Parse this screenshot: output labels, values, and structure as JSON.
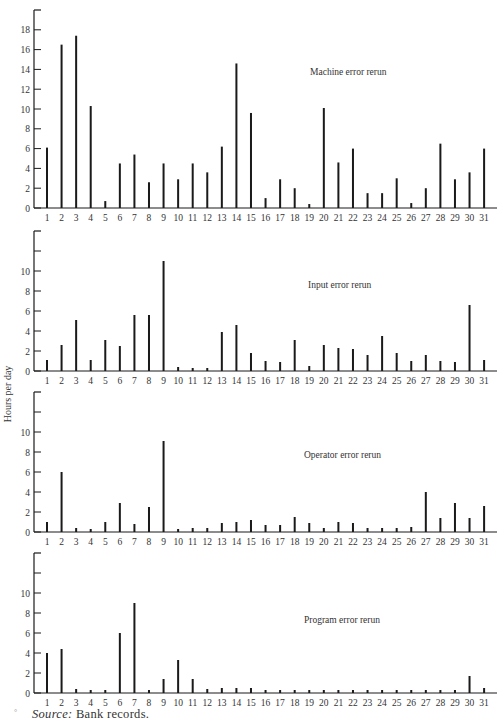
{
  "figure": {
    "y_axis_label": "Hours per day",
    "source_label": "Source:",
    "source_text": " Bank records.",
    "source_mark": "°"
  },
  "chart_data": [
    {
      "type": "bar",
      "title": "Machine error rerun",
      "xlabel": "",
      "ylabel": "Hours per day",
      "categories": [
        "1",
        "2",
        "3",
        "4",
        "5",
        "6",
        "7",
        "8",
        "9",
        "10",
        "11",
        "12",
        "13",
        "14",
        "15",
        "16",
        "17",
        "18",
        "19",
        "20",
        "21",
        "22",
        "23",
        "24",
        "25",
        "26",
        "27",
        "28",
        "29",
        "30",
        "31"
      ],
      "values": [
        6.1,
        16.5,
        17.4,
        10.3,
        0.7,
        4.5,
        5.4,
        2.6,
        4.5,
        2.9,
        4.5,
        3.6,
        6.2,
        14.6,
        9.6,
        1.0,
        2.9,
        2.0,
        0.4,
        10.1,
        4.6,
        6.0,
        1.5,
        1.5,
        3.0,
        0.5,
        2.0,
        6.5,
        2.9,
        3.6,
        6.0
      ],
      "ylim": [
        0,
        20
      ],
      "yticks": [
        0,
        2,
        4,
        6,
        8,
        10,
        12,
        14,
        16,
        18
      ],
      "grid": false,
      "legend": "none"
    },
    {
      "type": "bar",
      "title": "Input error rerun",
      "xlabel": "",
      "ylabel": "Hours per day",
      "categories": [
        "1",
        "2",
        "3",
        "4",
        "5",
        "6",
        "7",
        "8",
        "9",
        "10",
        "11",
        "12",
        "13",
        "14",
        "15",
        "16",
        "17",
        "18",
        "19",
        "20",
        "21",
        "22",
        "23",
        "24",
        "25",
        "26",
        "27",
        "28",
        "29",
        "30",
        "31"
      ],
      "values": [
        1.1,
        2.6,
        5.1,
        1.1,
        3.1,
        2.5,
        5.6,
        5.6,
        11.0,
        0.4,
        0.3,
        0.3,
        3.9,
        4.6,
        1.8,
        1.0,
        0.9,
        3.1,
        0.5,
        2.6,
        2.3,
        2.2,
        1.6,
        3.5,
        1.8,
        1.0,
        1.6,
        1.0,
        0.9,
        6.6,
        1.1
      ],
      "ylim": [
        0,
        14
      ],
      "yticks": [
        0,
        2,
        4,
        6,
        8,
        10
      ],
      "grid": false,
      "legend": "none"
    },
    {
      "type": "bar",
      "title": "Operator error rerun",
      "xlabel": "",
      "ylabel": "Hours per day",
      "categories": [
        "1",
        "2",
        "3",
        "4",
        "5",
        "6",
        "7",
        "8",
        "9",
        "10",
        "11",
        "12",
        "13",
        "14",
        "15",
        "16",
        "17",
        "18",
        "19",
        "20",
        "21",
        "22",
        "23",
        "24",
        "25",
        "26",
        "27",
        "28",
        "29",
        "30",
        "31"
      ],
      "values": [
        1.0,
        6.0,
        0.4,
        0.3,
        1.0,
        2.9,
        0.8,
        2.5,
        9.1,
        0.3,
        0.4,
        0.4,
        0.9,
        1.0,
        1.2,
        0.7,
        0.7,
        1.5,
        0.9,
        0.4,
        1.0,
        0.9,
        0.4,
        0.4,
        0.4,
        0.5,
        4.0,
        1.4,
        2.9,
        1.4,
        2.6
      ],
      "ylim": [
        0,
        14
      ],
      "yticks": [
        0,
        2,
        4,
        6,
        8,
        10
      ],
      "grid": false,
      "legend": "none"
    },
    {
      "type": "bar",
      "title": "Program error rerun",
      "xlabel": "",
      "ylabel": "Hours per day",
      "categories": [
        "1",
        "2",
        "3",
        "4",
        "5",
        "6",
        "7",
        "8",
        "9",
        "10",
        "11",
        "12",
        "13",
        "14",
        "15",
        "16",
        "17",
        "18",
        "19",
        "20",
        "21",
        "22",
        "23",
        "24",
        "25",
        "26",
        "27",
        "28",
        "29",
        "30",
        "31"
      ],
      "values": [
        4.0,
        4.4,
        0.4,
        0.3,
        0.3,
        6.0,
        9.0,
        0.3,
        1.4,
        3.3,
        1.4,
        0.4,
        0.5,
        0.5,
        0.5,
        0.3,
        0.3,
        0.3,
        0.3,
        0.3,
        0.3,
        0.3,
        0.3,
        0.3,
        0.3,
        0.3,
        0.3,
        0.3,
        0.3,
        1.7,
        0.5
      ],
      "ylim": [
        0,
        14
      ],
      "yticks": [
        0,
        2,
        4,
        6,
        8,
        10
      ],
      "grid": false,
      "legend": "none"
    }
  ],
  "layout": {
    "panels": [
      {
        "axis_top": 10,
        "zero_y": 208,
        "px_per_unit": 9.9,
        "title_x": 310,
        "title_y": 75
      },
      {
        "axis_top": 231,
        "zero_y": 371,
        "px_per_unit": 10,
        "title_x": 308,
        "title_y": 288
      },
      {
        "axis_top": 392,
        "zero_y": 532,
        "px_per_unit": 10,
        "title_x": 304,
        "title_y": 458
      },
      {
        "axis_top": 553,
        "zero_y": 693,
        "px_per_unit": 10,
        "title_x": 304,
        "title_y": 623
      }
    ],
    "axis_x": 34,
    "axis_right": 497,
    "first_bar_x": 47,
    "bar_spacing": 14.57,
    "colors": {
      "ink": "#1a1a1a",
      "text": "#333333",
      "background": "#ffffff"
    }
  }
}
